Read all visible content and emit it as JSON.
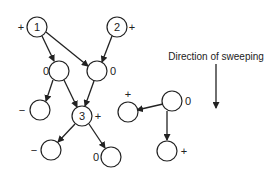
{
  "caption": "Direction of sweeping",
  "nodes": [
    {
      "id": "n1",
      "label": "1",
      "sign": "+"
    },
    {
      "id": "n2",
      "label": "2",
      "sign": "+"
    },
    {
      "id": "nA",
      "label": "",
      "sign": "0"
    },
    {
      "id": "nB",
      "label": "",
      "sign": "0"
    },
    {
      "id": "nC",
      "label": "",
      "sign": "−"
    },
    {
      "id": "n3",
      "label": "3",
      "sign": "+"
    },
    {
      "id": "nD",
      "label": "",
      "sign": "−"
    },
    {
      "id": "nE",
      "label": "",
      "sign": "0"
    },
    {
      "id": "nF",
      "label": "",
      "sign": "+"
    },
    {
      "id": "nG",
      "label": "",
      "sign": "0"
    },
    {
      "id": "nH",
      "label": "",
      "sign": "+"
    }
  ],
  "edges": [
    {
      "from": "n1",
      "to": "nA"
    },
    {
      "from": "n1",
      "to": "nB"
    },
    {
      "from": "n2",
      "to": "nB"
    },
    {
      "from": "nA",
      "to": "nC"
    },
    {
      "from": "nA",
      "to": "n3"
    },
    {
      "from": "nB",
      "to": "n3"
    },
    {
      "from": "n3",
      "to": "nD"
    },
    {
      "from": "n3",
      "to": "nE"
    },
    {
      "from": "nG",
      "to": "nF"
    },
    {
      "from": "nG",
      "to": "nH"
    }
  ]
}
